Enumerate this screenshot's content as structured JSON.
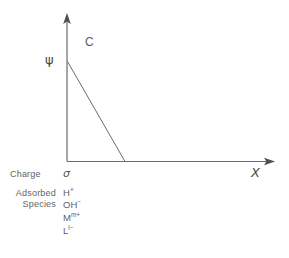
{
  "figure": {
    "axes": {
      "y_axis_name": "psi-axis",
      "x_axis_label": "X",
      "y_axis_label": "ψ",
      "origin_label": "σ"
    },
    "curve": {
      "label": "C",
      "description": "linear decay from psi at surface to zero"
    },
    "rows": [
      {
        "name": "charge-row",
        "label": "Charge",
        "label_lines": [
          "Charge"
        ],
        "values": [
          {
            "base": "σ",
            "sup": ""
          }
        ]
      },
      {
        "name": "adsorbed-species-row",
        "label": "Adsorbed Species",
        "label_lines": [
          "Adsorbed",
          "Species"
        ],
        "values": [
          {
            "base": "H",
            "sup": "+"
          },
          {
            "base": "OH",
            "sup": "−"
          },
          {
            "base": "M",
            "sup": "m+"
          },
          {
            "base": "L",
            "sup": "l−"
          }
        ]
      }
    ],
    "colors": {
      "line": "#6b6b6b",
      "text": "#5e5e5e",
      "background": "#ffffff"
    }
  }
}
